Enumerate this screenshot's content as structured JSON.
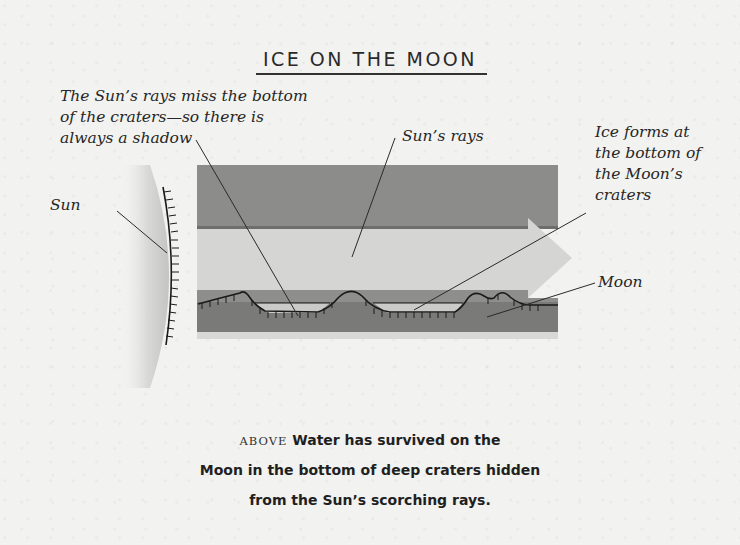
{
  "figure": {
    "title": "ICE ON THE MOON",
    "labels": {
      "shadow_note": [
        "The Sun’s rays miss the bottom",
        "of the craters—so there is",
        "always a shadow"
      ],
      "suns_rays": "Sun’s rays",
      "ice_note": [
        "Ice forms at",
        "the bottom of",
        "the Moon’s",
        "craters"
      ],
      "sun": "Sun",
      "moon": "Moon"
    },
    "caption": {
      "prefix": "ABOVE",
      "line1": "Water has survived on the",
      "line2": "Moon in the bottom of deep craters hidden",
      "line3": "from the Sun’s scorching rays."
    },
    "colors": {
      "background": "#f2f2f0",
      "dark_band": "#8a8a8a",
      "light_band": "#d4d4d2",
      "moon_surface": "#7a7a7a",
      "ice_pool": "#c8c8c6",
      "ink": "#1a1a1a"
    }
  }
}
